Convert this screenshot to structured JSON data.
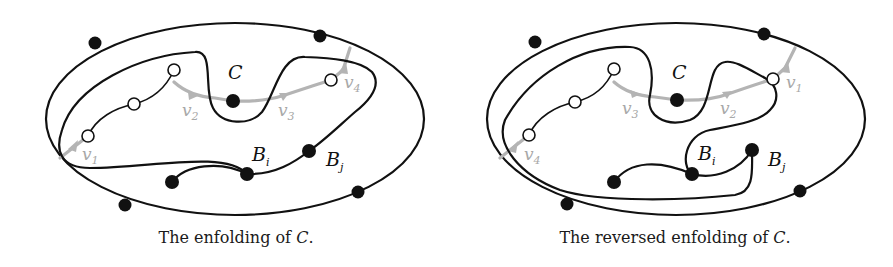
{
  "figures": [
    {
      "id": "enfolding",
      "caption_text": "The enfolding of ",
      "caption_symbol": "C",
      "caption_end": ".",
      "cycle_label": "C",
      "vertex_labels": [
        "v",
        "v",
        "v",
        "v"
      ],
      "vertex_subs": [
        "1",
        "2",
        "3",
        "4"
      ],
      "block_labels": [
        {
          "main": "B",
          "sub": "i"
        },
        {
          "main": "B",
          "sub": "j"
        }
      ]
    },
    {
      "id": "reversed-enfolding",
      "caption_text": "The reversed enfolding of ",
      "caption_symbol": "C",
      "caption_end": ".",
      "cycle_label": "C",
      "vertex_labels": [
        "v",
        "v",
        "v",
        "v"
      ],
      "vertex_subs": [
        "4",
        "3",
        "2",
        "1"
      ],
      "block_labels": [
        {
          "main": "B",
          "sub": "i"
        },
        {
          "main": "B",
          "sub": "j"
        }
      ]
    }
  ],
  "colors": {
    "curve": "#111111",
    "cycle_path": "#b4b4b4",
    "background": "#ffffff"
  }
}
